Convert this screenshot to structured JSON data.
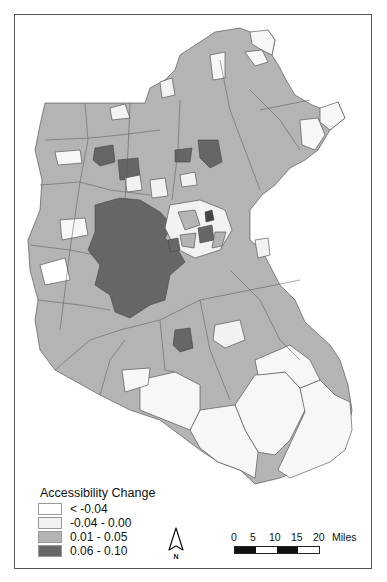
{
  "map": {
    "region": "Boston metropolitan area municipalities / zones",
    "colors": {
      "lt_neg004": "#ffffff",
      "neg004_000": "#f2f2f2",
      "p001_005": "#b4b4b4",
      "p006_010": "#666666",
      "outline": "#444444"
    }
  },
  "legend": {
    "title": "Accessibility Change",
    "items": [
      {
        "label": "< -0.04",
        "color": "#ffffff"
      },
      {
        "label": "-0.04 - 0.00",
        "color": "#f2f2f2"
      },
      {
        "label": "0.01 - 0.05",
        "color": "#b4b4b4"
      },
      {
        "label": "0.06 - 0.10",
        "color": "#666666"
      }
    ]
  },
  "north_arrow": {
    "label": "N"
  },
  "scale_bar": {
    "ticks": [
      "0",
      "5",
      "10",
      "15",
      "20"
    ],
    "unit": "Miles"
  }
}
